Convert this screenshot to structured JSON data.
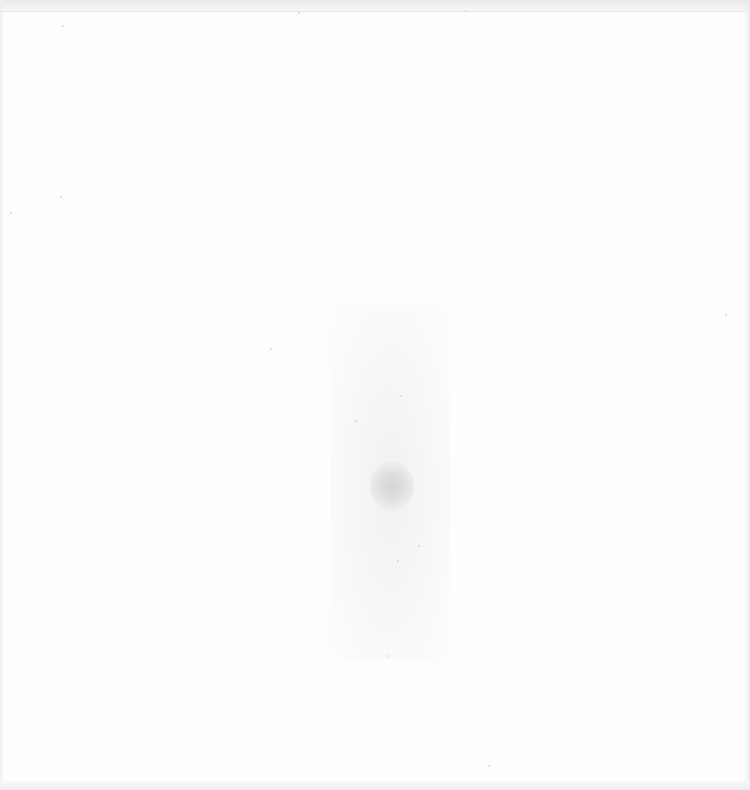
{
  "page": {
    "background_color": "#fdfdfd",
    "smudge_color": "#d4d4d4"
  }
}
